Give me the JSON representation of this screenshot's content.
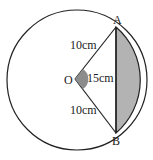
{
  "diagram": {
    "type": "circle-segment",
    "center_label": "O",
    "point_a_label": "A",
    "point_b_label": "B",
    "radius_oa_label": "10cm",
    "radius_ob_label": "10cm",
    "chord_ab_label": "15cm",
    "colors": {
      "stroke": "#222222",
      "segment_fill": "#b3b3b3",
      "angle_fill": "#8c8c8c"
    }
  }
}
